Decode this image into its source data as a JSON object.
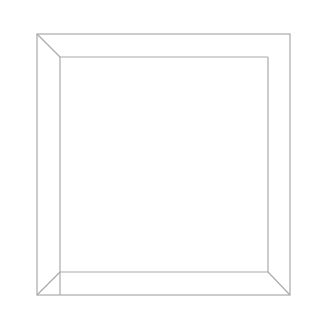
{
  "chart_data": {
    "type": "scatter",
    "title": "",
    "xlabel": "",
    "ylabel": "",
    "zlabel": "",
    "view": "3D scatter viewed from top",
    "x_ticks": [
      "-2",
      "-1",
      "0",
      "1",
      "2"
    ],
    "y_ticks": [
      "-2",
      "-1",
      "0",
      "1",
      "2"
    ],
    "z_ticks": [
      "-0.05",
      "0.00",
      "0.05"
    ],
    "xlim": [
      -2,
      2
    ],
    "ylim": [
      -2,
      2
    ],
    "zlim": [
      -0.05,
      0.05
    ],
    "grid": false,
    "legend": null,
    "point_color": "#333333"
  },
  "axes": {
    "top": {
      "labels": [
        "-2",
        "-1",
        "0",
        "1",
        "2"
      ]
    },
    "right": {
      "labels": [
        "-2",
        "-1",
        "0",
        "1",
        "2"
      ]
    },
    "z": {
      "labels": [
        "-0.05",
        "0.00",
        "0.05"
      ]
    }
  }
}
